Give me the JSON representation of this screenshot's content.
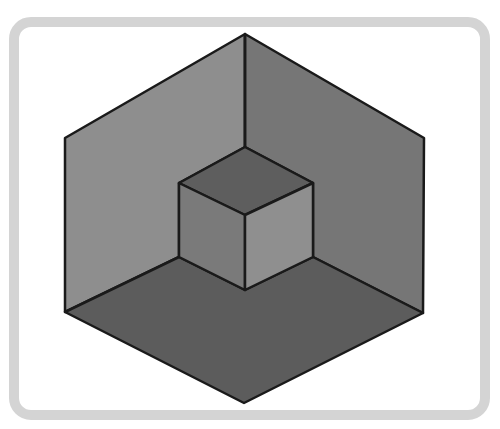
{
  "figure": {
    "frame": {
      "border_color": "#d4d4d4",
      "background": "#ffffff"
    },
    "stroke_color": "#1a1a1a",
    "outer_hexagon": {
      "top": [
        245,
        34
      ],
      "upper_right": [
        424,
        138
      ],
      "lower_right": [
        423,
        313
      ],
      "bottom": [
        244,
        403
      ],
      "lower_left": [
        65,
        312
      ],
      "upper_left": [
        65,
        138
      ],
      "center": [
        245,
        215
      ]
    },
    "faces": {
      "left_wall": {
        "color": "#8e8e8e"
      },
      "right_wall": {
        "color": "#767676"
      },
      "floor": {
        "color": "#5c5c5c"
      },
      "cube_top": {
        "color": "#5e5e5e"
      },
      "cube_left": {
        "color": "#7a7a7a"
      },
      "cube_right": {
        "color": "#8f8f8f"
      }
    },
    "inner_cube": {
      "top": [
        245,
        147
      ],
      "left_top": [
        179,
        183
      ],
      "right_top": [
        313,
        183
      ],
      "center": [
        245,
        215
      ],
      "left_bottom": [
        179,
        257
      ],
      "right_bottom": [
        313,
        257
      ],
      "bottom": [
        245,
        290
      ]
    }
  }
}
